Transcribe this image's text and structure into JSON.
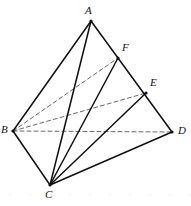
{
  "figure": {
    "type": "geometry-diagram",
    "width": 191,
    "height": 206,
    "background_color": "#ffffff",
    "stroke_color": "#101010",
    "dashed_stroke_color": "#6a6a6a",
    "solid_line_width": 1.5,
    "dashed_line_width": 1.0,
    "dash_pattern": "4,3"
  },
  "points": [
    {
      "id": "A",
      "label": "A",
      "x": 91,
      "y": 21,
      "label_x": 85,
      "label_y": 5,
      "marker": true
    },
    {
      "id": "B",
      "label": "B",
      "x": 13,
      "y": 131,
      "label_x": 1,
      "label_y": 124,
      "marker": true
    },
    {
      "id": "C",
      "label": "C",
      "x": 50,
      "y": 185,
      "label_x": 45,
      "label_y": 189,
      "marker": true
    },
    {
      "id": "D",
      "label": "D",
      "x": 172,
      "y": 132,
      "label_x": 178,
      "label_y": 125,
      "marker": true
    },
    {
      "id": "E",
      "label": "E",
      "x": 146,
      "y": 93,
      "label_x": 150,
      "label_y": 77,
      "marker": true
    },
    {
      "id": "F",
      "label": "F",
      "x": 118,
      "y": 58,
      "label_x": 122,
      "label_y": 42,
      "marker": true
    }
  ],
  "solid_edges": [
    {
      "id": "AB",
      "from": "A",
      "to": "B"
    },
    {
      "id": "AC",
      "from": "A",
      "to": "C"
    },
    {
      "id": "AD",
      "from": "A",
      "to": "D"
    },
    {
      "id": "BC",
      "from": "B",
      "to": "C"
    },
    {
      "id": "CD",
      "from": "C",
      "to": "D"
    },
    {
      "id": "CF",
      "from": "C",
      "to": "F"
    },
    {
      "id": "CE",
      "from": "C",
      "to": "E"
    }
  ],
  "dashed_edges": [
    {
      "id": "BD",
      "from": "B",
      "to": "D"
    },
    {
      "id": "BF",
      "from": "B",
      "to": "F"
    },
    {
      "id": "BE",
      "from": "B",
      "to": "E"
    }
  ],
  "watermark": {
    "text": "· · · · · · · · · · · ·"
  }
}
